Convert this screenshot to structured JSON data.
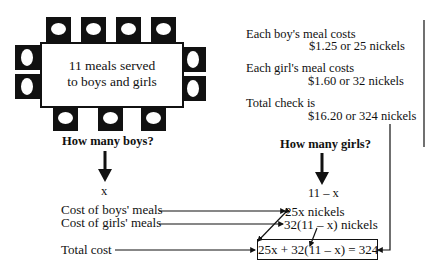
{
  "table": {
    "line1": "11 meals served",
    "line2": "to boys and girls",
    "seats": 12
  },
  "facts": [
    {
      "label": "Each boy's meal costs",
      "value": "$1.25 or 25 nickels"
    },
    {
      "label": "Each girl's meal costs",
      "value": "$1.60 or 32 nickels"
    },
    {
      "label": "Total check is",
      "value": "$16.20 or 324 nickels"
    }
  ],
  "questions": {
    "boys": "How many boys?",
    "girls": "How many girls?"
  },
  "variables": {
    "boys": "x",
    "girls": "11 – x"
  },
  "cost_labels": {
    "boys": "Cost of boys' meals",
    "girls": "Cost of girls' meals",
    "total": "Total cost"
  },
  "cost_values": {
    "boys": "25x nickels",
    "girls": "32(11 – x) nickels"
  },
  "equation": "25x + 32(11 – x) = 324"
}
